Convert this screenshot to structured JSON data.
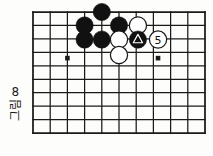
{
  "figure": {
    "caption_text": "그림",
    "caption_number": "8",
    "background_color": "#fdfdfb",
    "line_color": "#1a1a1a",
    "black_stone_color": "#111111",
    "white_stone_color": "#ffffff"
  },
  "board": {
    "columns": 11,
    "rows": 10,
    "origin_x": 33,
    "origin_y": 12,
    "col_spacing": 17.2,
    "row_spacing": 13.45,
    "stone_radius": 8.6,
    "star_points": [
      {
        "col": 2,
        "row": 3.43
      },
      {
        "col": 7.27,
        "row": 3.43
      }
    ]
  },
  "stones": [
    {
      "id": "b1",
      "color": "black",
      "col": 4,
      "row": 0,
      "label": "",
      "mark": ""
    },
    {
      "id": "b2",
      "color": "black",
      "col": 3,
      "row": 1,
      "label": "",
      "mark": ""
    },
    {
      "id": "b3",
      "color": "black",
      "col": 5,
      "row": 1,
      "label": "",
      "mark": ""
    },
    {
      "id": "w1",
      "color": "white",
      "col": 6.1,
      "row": 1,
      "label": "",
      "mark": ""
    },
    {
      "id": "b4",
      "color": "black",
      "col": 3,
      "row": 2.05,
      "label": "",
      "mark": ""
    },
    {
      "id": "b5",
      "color": "black",
      "col": 4,
      "row": 2.05,
      "label": "",
      "mark": ""
    },
    {
      "id": "w2",
      "color": "white",
      "col": 5,
      "row": 2.05,
      "label": "",
      "mark": ""
    },
    {
      "id": "b6",
      "color": "black",
      "col": 6.1,
      "row": 2.05,
      "label": "",
      "mark": "triangle"
    },
    {
      "id": "w3",
      "color": "white",
      "col": 7.27,
      "row": 2.05,
      "label": "5",
      "mark": ""
    },
    {
      "id": "w4",
      "color": "white",
      "col": 5,
      "row": 3.2,
      "label": "",
      "mark": ""
    }
  ]
}
